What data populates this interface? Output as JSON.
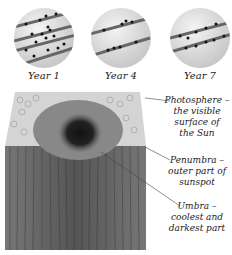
{
  "panels": [
    {
      "label": "Year 1",
      "bands": 4
    },
    {
      "label": "Year 4",
      "bands": 2
    },
    {
      "label": "Year 7",
      "bands": 2
    }
  ],
  "callouts": [
    {
      "title": "Photosphere –",
      "lines": [
        "the visible",
        "surface of",
        "the Sun"
      ]
    },
    {
      "title": "Penumbra –",
      "lines": [
        "outer part of",
        "sunspot"
      ]
    },
    {
      "title": "Umbra –",
      "lines": [
        "coolest and",
        "darkest part"
      ]
    }
  ]
}
